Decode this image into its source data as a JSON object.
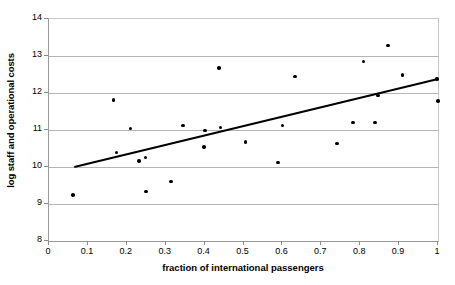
{
  "chart_data": {
    "type": "scatter",
    "title": "",
    "xlabel": "fraction of international passengers",
    "ylabel": "log staff and operational costs",
    "xlim": [
      0,
      1
    ],
    "ylim": [
      8,
      14
    ],
    "xticks": [
      "0",
      "0.1",
      "0.2",
      "0.3",
      "0.4",
      "0.5",
      "0.6",
      "0.7",
      "0.8",
      "0.9",
      "1"
    ],
    "xtick_values": [
      0,
      0.1,
      0.2,
      0.3,
      0.4,
      0.5,
      0.6,
      0.7,
      0.8,
      0.9,
      1
    ],
    "yticks": [
      "8",
      "9",
      "10",
      "11",
      "12",
      "13",
      "14"
    ],
    "ytick_values": [
      8,
      9,
      10,
      11,
      12,
      13,
      14
    ],
    "grid": "horizontal",
    "legend": "none",
    "marker": "filled-circle",
    "marker_color": "#000000",
    "gridline_color": "#b5b5b5",
    "axis_color": "#8a8a8a",
    "points": [
      {
        "x": 0.062,
        "y": 9.25
      },
      {
        "x": 0.166,
        "y": 11.81
      },
      {
        "x": 0.174,
        "y": 10.39
      },
      {
        "x": 0.209,
        "y": 11.04
      },
      {
        "x": 0.232,
        "y": 10.16
      },
      {
        "x": 0.248,
        "y": 10.26
      },
      {
        "x": 0.25,
        "y": 9.34
      },
      {
        "x": 0.313,
        "y": 9.61
      },
      {
        "x": 0.345,
        "y": 11.12
      },
      {
        "x": 0.398,
        "y": 10.54
      },
      {
        "x": 0.401,
        "y": 10.99
      },
      {
        "x": 0.437,
        "y": 12.67
      },
      {
        "x": 0.441,
        "y": 11.07
      },
      {
        "x": 0.505,
        "y": 10.68
      },
      {
        "x": 0.589,
        "y": 10.12
      },
      {
        "x": 0.6,
        "y": 11.12
      },
      {
        "x": 0.632,
        "y": 12.45
      },
      {
        "x": 0.74,
        "y": 10.63
      },
      {
        "x": 0.782,
        "y": 11.2
      },
      {
        "x": 0.808,
        "y": 12.85
      },
      {
        "x": 0.838,
        "y": 11.2
      },
      {
        "x": 0.845,
        "y": 11.93
      },
      {
        "x": 0.871,
        "y": 13.28
      },
      {
        "x": 0.909,
        "y": 12.48
      },
      {
        "x": 0.998,
        "y": 12.38
      },
      {
        "x": 1.0,
        "y": 11.78
      }
    ],
    "trendline": {
      "type": "linear-fit",
      "x_start": 0.065,
      "y_start": 10.0,
      "x_end": 1.0,
      "y_end": 12.38,
      "color": "#000000",
      "width": 2
    }
  }
}
